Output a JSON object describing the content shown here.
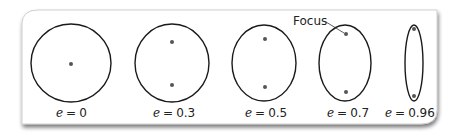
{
  "figure": {
    "focus_label": "Focus",
    "colors": {
      "stroke": "#1a1a1a",
      "focus": "#555555",
      "panel": "#ffffff",
      "panel_border": "#b8b8b8",
      "shadow": "#9a9a9a"
    },
    "ellipses": [
      {
        "e_var": "e",
        "eq": "=",
        "value": "0",
        "label": "e = 0"
      },
      {
        "e_var": "e",
        "eq": "=",
        "value": "0.3",
        "label": "e = 0.3"
      },
      {
        "e_var": "e",
        "eq": "=",
        "value": "0.5",
        "label": "e = 0.5"
      },
      {
        "e_var": "e",
        "eq": "=",
        "value": "0.7",
        "label": "e = 0.7"
      },
      {
        "e_var": "e",
        "eq": "=",
        "value": "0.96",
        "label": "e = 0.96"
      }
    ]
  }
}
